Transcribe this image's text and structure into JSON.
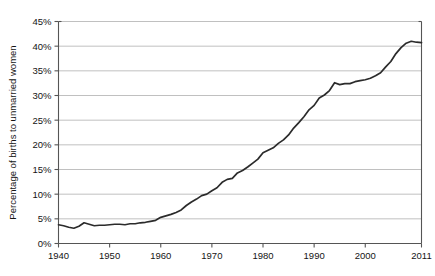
{
  "chart_data": {
    "type": "line",
    "title": "",
    "xlabel": "",
    "ylabel": "Percentage of births to unmarried women",
    "xlim": [
      1940,
      2011
    ],
    "ylim": [
      0,
      45
    ],
    "grid": "horizontal",
    "legend": "none",
    "y_tick_labels": [
      "0%",
      "5%",
      "10%",
      "15%",
      "20%",
      "25%",
      "30%",
      "35%",
      "40%",
      "45%"
    ],
    "y_tick_values": [
      0,
      5,
      10,
      15,
      20,
      25,
      30,
      35,
      40,
      45
    ],
    "x_tick_labels": [
      "1940",
      "1950",
      "1960",
      "1970",
      "1980",
      "1990",
      "2000",
      "2011"
    ],
    "x_tick_values": [
      1940,
      1950,
      1960,
      1970,
      1980,
      1990,
      2000,
      2011
    ],
    "line_color": "#2b2b2b",
    "grid_color": "#b9b9b9",
    "axis_color": "#555555",
    "series": [
      {
        "name": "Percentage of births to unmarried women",
        "x": [
          1940,
          1941,
          1942,
          1943,
          1944,
          1945,
          1946,
          1947,
          1948,
          1949,
          1950,
          1951,
          1952,
          1953,
          1954,
          1955,
          1956,
          1957,
          1958,
          1959,
          1960,
          1961,
          1962,
          1963,
          1964,
          1965,
          1966,
          1967,
          1968,
          1969,
          1970,
          1971,
          1972,
          1973,
          1974,
          1975,
          1976,
          1977,
          1978,
          1979,
          1980,
          1981,
          1982,
          1983,
          1984,
          1985,
          1986,
          1987,
          1988,
          1989,
          1990,
          1991,
          1992,
          1993,
          1994,
          1995,
          1996,
          1997,
          1998,
          1999,
          2000,
          2001,
          2002,
          2003,
          2004,
          2005,
          2006,
          2007,
          2008,
          2009,
          2010,
          2011
        ],
        "y": [
          3.8,
          3.6,
          3.3,
          3.1,
          3.5,
          4.2,
          3.9,
          3.6,
          3.7,
          3.7,
          3.8,
          3.9,
          3.9,
          3.8,
          4.0,
          4.0,
          4.2,
          4.3,
          4.5,
          4.7,
          5.3,
          5.6,
          5.9,
          6.3,
          6.8,
          7.7,
          8.4,
          9.0,
          9.7,
          10.0,
          10.7,
          11.3,
          12.4,
          13.0,
          13.2,
          14.3,
          14.8,
          15.5,
          16.3,
          17.1,
          18.4,
          18.9,
          19.4,
          20.3,
          21.0,
          22.0,
          23.4,
          24.5,
          25.7,
          27.1,
          28.0,
          29.5,
          30.1,
          31.0,
          32.6,
          32.2,
          32.4,
          32.4,
          32.8,
          33.0,
          33.2,
          33.5,
          34.0,
          34.6,
          35.8,
          36.9,
          38.5,
          39.7,
          40.6,
          41.0,
          40.8,
          40.7
        ]
      }
    ]
  },
  "axes": {
    "y_title": "Percentage of births to unmarried women"
  }
}
